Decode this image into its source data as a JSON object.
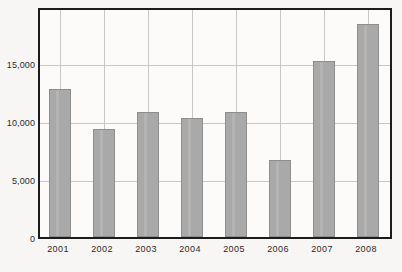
{
  "chart_data": {
    "type": "bar",
    "title": "",
    "subtitle": "",
    "xlabel": "",
    "ylabel": "",
    "categories": [
      "2001",
      "2002",
      "2003",
      "2004",
      "2005",
      "2006",
      "2007",
      "2008"
    ],
    "values": [
      13000,
      9500,
      11000,
      10500,
      11000,
      6800,
      15500,
      18800
    ],
    "ylim": [
      0,
      20000
    ],
    "ytick_labels": [
      "0",
      "5,000",
      "10,000",
      "15,000"
    ],
    "ytick_values": [
      0,
      5000,
      10000,
      15000
    ],
    "grid": true,
    "grid_horizontal": true,
    "grid_vertical": true,
    "legend": false,
    "legend_position": "none",
    "series": [
      {
        "name": "",
        "values": [
          13000,
          9500,
          11000,
          10500,
          11000,
          6800,
          15500,
          18800
        ]
      }
    ],
    "colors": {
      "bar_fill": "#a9a9a9",
      "bar_border": "#8e8e8e",
      "gridline": "#c9c7c4",
      "axis_frame": "#1c1c1c",
      "plot_background": "#fcfbfa",
      "page_background": "#f7f6f4",
      "label_text": "#2a2a2a"
    }
  }
}
